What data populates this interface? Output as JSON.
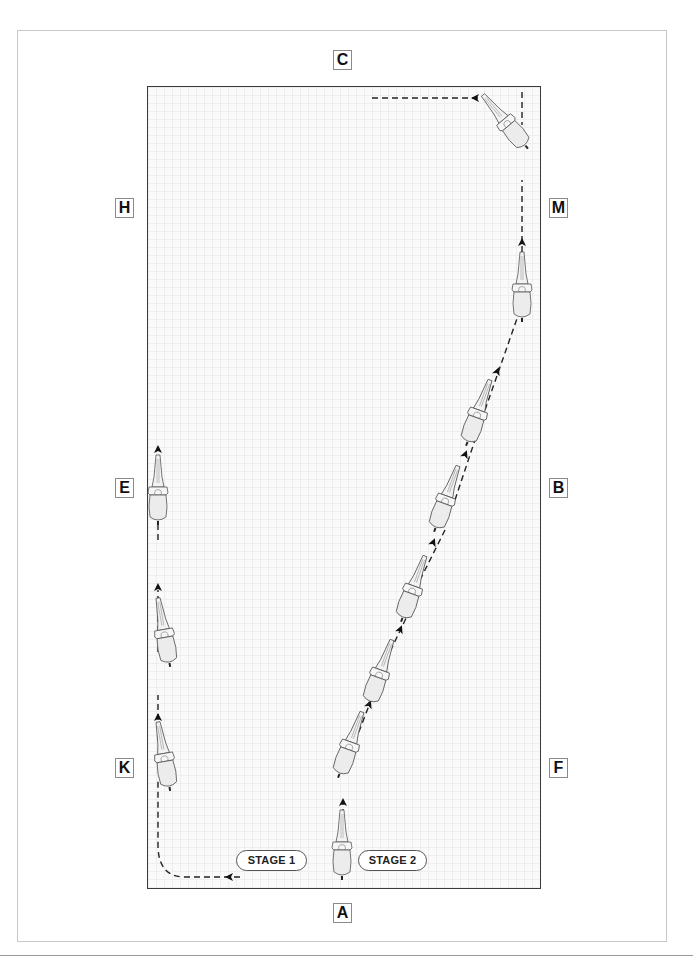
{
  "diagram": {
    "type": "dressage-arena-movement",
    "colors": {
      "arena_border": "#3a3a3a",
      "path": "#222222",
      "frame": "#c8c8c8",
      "grid": "#eeeeee"
    }
  },
  "markers": {
    "C": "C",
    "H": "H",
    "M": "M",
    "E": "E",
    "B": "B",
    "K": "K",
    "F": "F",
    "A": "A"
  },
  "stages": [
    {
      "label": "STAGE 1"
    },
    {
      "label": "STAGE 2"
    }
  ],
  "path_description": "Stage 1: horse tracks up the long side K–E; Stage 2: horse leaves from near A on a diagonal leg-yield toward M then turns along the short side toward C",
  "icons": {
    "horse": "horse-top-view-icon",
    "arrow": "path-direction-arrow-icon"
  }
}
